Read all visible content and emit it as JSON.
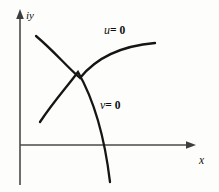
{
  "figure": {
    "background_color": "#fdfdfb",
    "width": 219,
    "height": 192,
    "axis_color": "#4a4a4a",
    "curve_color": "#151515",
    "labels": {
      "y_axis": "iy",
      "x_axis": "x",
      "curve_u": {
        "variable": "u",
        "relation": "= 0"
      },
      "curve_v": {
        "variable": "v",
        "relation": "= 0"
      }
    }
  },
  "chart_data": {
    "type": "line",
    "title": "",
    "subtitle": "",
    "xlabel": "x",
    "ylabel": "iy",
    "grid": false,
    "legend_position": "inline-annotations",
    "axes": {
      "origin_px": [
        20,
        145
      ],
      "x_axis": {
        "from_px": [
          20,
          145
        ],
        "to_px": [
          196,
          145
        ],
        "arrow": "right"
      },
      "y_axis": {
        "from_px": [
          20,
          185
        ],
        "to_px": [
          20,
          12
        ],
        "arrow": "up"
      },
      "xlim_px": [
        20,
        196
      ],
      "ylim_px": [
        185,
        12
      ]
    },
    "series": [
      {
        "name": "u = 0",
        "annotation": "u = 0",
        "annotation_px": [
          104,
          30
        ],
        "description": "concave-down arc rising left to right then flattening",
        "points_px": [
          [
            36,
            36
          ],
          [
            52,
            48
          ],
          [
            66,
            62
          ],
          [
            73,
            75
          ],
          [
            86,
            54
          ],
          [
            104,
            47
          ],
          [
            126,
            44
          ],
          [
            155,
            43
          ]
        ],
        "path": "M 36 36 C 55 52 66 66 80 78 C 96 58 120 46 155 43"
      },
      {
        "name": "v = 0",
        "annotation": "v = 0",
        "annotation_px": [
          100,
          105
        ],
        "description": "concave-right arc descending from upper-left to below the x-axis",
        "points_px": [
          [
            40,
            122
          ],
          [
            55,
            100
          ],
          [
            68,
            84
          ],
          [
            73,
            75
          ],
          [
            88,
            105
          ],
          [
            99,
            130
          ],
          [
            107,
            158
          ],
          [
            110,
            182
          ]
        ],
        "path": "M 40 122 C 54 101 66 88 78 72 C 94 100 105 140 110 182"
      }
    ],
    "intersection_px": [
      73,
      75
    ],
    "annotations": [
      {
        "text": "u = 0",
        "x_px": 104,
        "y_px": 30
      },
      {
        "text": "v = 0",
        "x_px": 100,
        "y_px": 105
      },
      {
        "text": "iy",
        "x_px": 26,
        "y_px": 10
      },
      {
        "text": "x",
        "x_px": 199,
        "y_px": 155
      }
    ]
  }
}
